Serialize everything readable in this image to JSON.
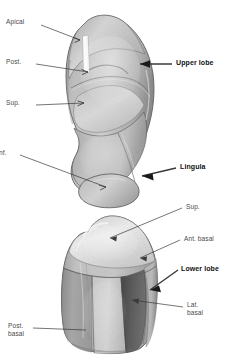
{
  "figure": {
    "background_color": "#ffffff",
    "specimens": [
      {
        "name": "upper-lobe-specimen",
        "label": "Upper lobe",
        "segments": [
          "Apical",
          "Post.",
          "Sup.",
          "Inf.",
          "Lingula"
        ]
      },
      {
        "name": "lower-lobe-specimen",
        "label": "Lower lobe",
        "segments": [
          "Sup.",
          "Ant. basal",
          "Lat. basal",
          "Post. basal"
        ]
      }
    ]
  },
  "labels": {
    "apical": "Apical",
    "post": "Post.",
    "sup_upper": "Sup.",
    "inf": "nf.",
    "upper_lobe": "Upper lobe",
    "lingula": "Lingula",
    "sup_lower": "Sup.",
    "ant_basal": "Ant. basal",
    "lower_lobe": "Lower lobe",
    "lat_basal": "Lat.\nbasal",
    "post_basal": "Post.\nbasal"
  },
  "colors": {
    "background": "#ffffff",
    "leader_line": "#3a3a3a",
    "label_text": "#4a4a4a",
    "bold_text": "#111111",
    "tissue_mid": "#b8b8b8",
    "tissue_light": "#e2e2e2",
    "tissue_highlight": "#f0f0f0",
    "tissue_dark": "#4a4a4a",
    "tissue_shadow": "#8a8a8a",
    "tissue_outline": "#5a5a5a",
    "probe_white": "#fbfbfb"
  }
}
